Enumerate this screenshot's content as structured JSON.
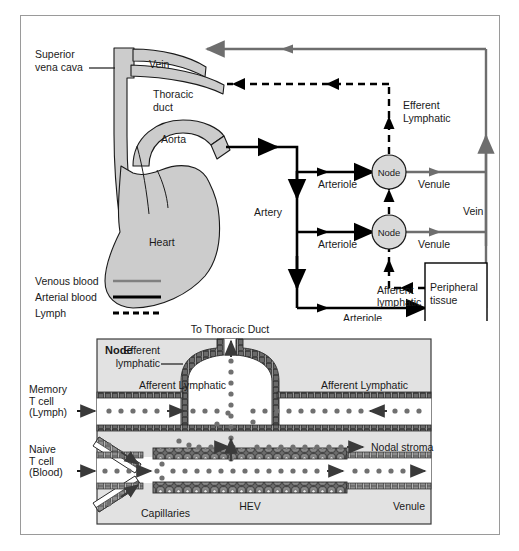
{
  "figure": {
    "upper_panel": {
      "name": "systemic-circulation-overview",
      "labels": {
        "superior_vena_cava": "Superior\nvena cava",
        "superior_vena_cava_line1": "Superior",
        "superior_vena_cava_line2": "vena cava",
        "vein_top": "Vein",
        "thoracic_duct_line1": "Thoracic",
        "thoracic_duct_line2": "duct",
        "aorta": "Aorta",
        "heart": "Heart",
        "artery": "Artery",
        "vein_right": "Vein",
        "efferent_lymphatic_line1": "Efferent",
        "efferent_lymphatic_line2": "Lymphatic",
        "afferent_lymphatic_line1": "Afferent",
        "afferent_lymphatic_line2": "lymphatic",
        "peripheral_tissue_line1": "Peripheral",
        "peripheral_tissue_line2": "tissue",
        "node_upper": "Node",
        "node_lower": "Node",
        "arteriole_upper": "Arteriole",
        "arteriole_middle": "Arteriole",
        "arteriole_lower": "Arteriole",
        "venule_upper": "Venule",
        "venule_lower": "Venule"
      },
      "legend": {
        "name": "line-style-legend",
        "items": [
          {
            "label": "Venous blood",
            "style": "solid-gray",
            "color": "#808080"
          },
          {
            "label": "Arterial blood",
            "style": "solid-black",
            "color": "#000000"
          },
          {
            "label": "Lymph",
            "style": "dashed-black",
            "color": "#000000"
          }
        ]
      }
    },
    "lower_panel": {
      "name": "lymph-node-detail",
      "labels": {
        "node": "Node",
        "to_thoracic_duct": "To Thoracic Duct",
        "efferent_lymphatic_line1": "Efferent",
        "efferent_lymphatic_line2": "lymphatic",
        "afferent_lymphatic_left": "Afferent Lymphatic",
        "afferent_lymphatic_right": "Afferent Lymphatic",
        "memory_t_cell_line1": "Memory",
        "memory_t_cell_line2": "T cell",
        "memory_t_cell_line3": "(Lymph)",
        "naive_t_cell_line1": "Naive",
        "naive_t_cell_line2": "T cell",
        "naive_t_cell_line3": "(Blood)",
        "nodal_stroma": "Nodal stroma",
        "capillaries": "Capillaries",
        "hev": "HEV",
        "venule": "Venule"
      }
    },
    "colors": {
      "venous": "#6e6e6e",
      "arterial": "#000000",
      "lymph": "#000000",
      "organ_fill": "#cccccc",
      "node_fill": "#d9d9d9",
      "panel_fill": "#e0e0e0",
      "vessel_wall": "#5a5a5a",
      "frame": "#9a9a9a",
      "cell_dot": "#707070"
    }
  }
}
